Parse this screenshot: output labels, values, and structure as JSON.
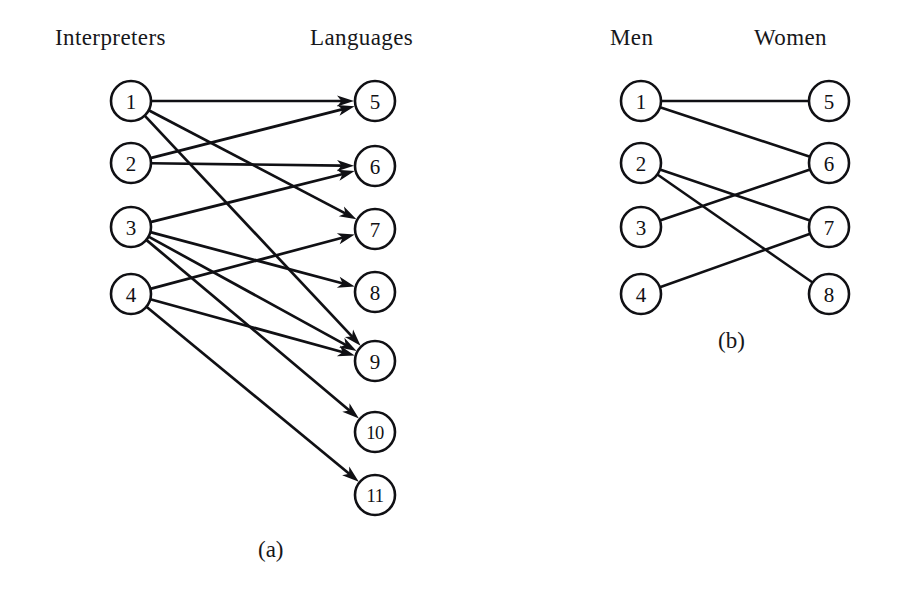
{
  "figure": {
    "width": 918,
    "height": 610,
    "background_color": "#ffffff",
    "ink_color": "#101014",
    "node_radius": 20,
    "node_fill": "#ffffff"
  },
  "panels": [
    {
      "id": "panel-a",
      "caption": "(a)",
      "caption_x": 258,
      "caption_y": 557,
      "directed": true,
      "headings": [
        {
          "text": "Interpreters",
          "x": 55,
          "y": 45
        },
        {
          "text": "Languages",
          "x": 310,
          "y": 45
        }
      ],
      "left_nodes": [
        {
          "id": "a1",
          "label": "1",
          "x": 131,
          "y": 101
        },
        {
          "id": "a2",
          "label": "2",
          "x": 131,
          "y": 163
        },
        {
          "id": "a3",
          "label": "3",
          "x": 131,
          "y": 227
        },
        {
          "id": "a4",
          "label": "4",
          "x": 131,
          "y": 294
        }
      ],
      "right_nodes": [
        {
          "id": "a5",
          "label": "5",
          "x": 375,
          "y": 101
        },
        {
          "id": "a6",
          "label": "6",
          "x": 375,
          "y": 166
        },
        {
          "id": "a7",
          "label": "7",
          "x": 375,
          "y": 229
        },
        {
          "id": "a8",
          "label": "8",
          "x": 375,
          "y": 292
        },
        {
          "id": "a9",
          "label": "9",
          "x": 375,
          "y": 361
        },
        {
          "id": "a10",
          "label": "10",
          "x": 375,
          "y": 432
        },
        {
          "id": "a11",
          "label": "11",
          "x": 375,
          "y": 495
        }
      ],
      "edges": [
        {
          "from": "a1",
          "to": "a5"
        },
        {
          "from": "a1",
          "to": "a7"
        },
        {
          "from": "a1",
          "to": "a9"
        },
        {
          "from": "a2",
          "to": "a5"
        },
        {
          "from": "a2",
          "to": "a6"
        },
        {
          "from": "a3",
          "to": "a6"
        },
        {
          "from": "a3",
          "to": "a8"
        },
        {
          "from": "a3",
          "to": "a9"
        },
        {
          "from": "a3",
          "to": "a10"
        },
        {
          "from": "a4",
          "to": "a7"
        },
        {
          "from": "a4",
          "to": "a9"
        },
        {
          "from": "a4",
          "to": "a11"
        }
      ]
    },
    {
      "id": "panel-b",
      "caption": "(b)",
      "caption_x": 718,
      "caption_y": 348,
      "directed": false,
      "headings": [
        {
          "text": "Men",
          "x": 610,
          "y": 45
        },
        {
          "text": "Women",
          "x": 754,
          "y": 45
        }
      ],
      "left_nodes": [
        {
          "id": "b1",
          "label": "1",
          "x": 641,
          "y": 101
        },
        {
          "id": "b2",
          "label": "2",
          "x": 641,
          "y": 163
        },
        {
          "id": "b3",
          "label": "3",
          "x": 641,
          "y": 227
        },
        {
          "id": "b4",
          "label": "4",
          "x": 641,
          "y": 294
        }
      ],
      "right_nodes": [
        {
          "id": "b5",
          "label": "5",
          "x": 829,
          "y": 101
        },
        {
          "id": "b6",
          "label": "6",
          "x": 829,
          "y": 163
        },
        {
          "id": "b7",
          "label": "7",
          "x": 829,
          "y": 227
        },
        {
          "id": "b8",
          "label": "8",
          "x": 829,
          "y": 294
        }
      ],
      "edges": [
        {
          "from": "b1",
          "to": "b5"
        },
        {
          "from": "b1",
          "to": "b6"
        },
        {
          "from": "b2",
          "to": "b7"
        },
        {
          "from": "b2",
          "to": "b8"
        },
        {
          "from": "b3",
          "to": "b6"
        },
        {
          "from": "b4",
          "to": "b7"
        }
      ]
    }
  ]
}
